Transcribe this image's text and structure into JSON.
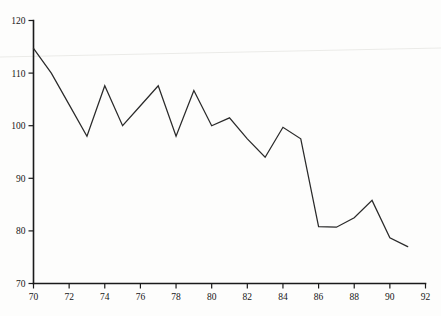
{
  "chart_data": {
    "type": "line",
    "title": "",
    "subtitle": "",
    "xlabel": "",
    "ylabel": "",
    "xlim": [
      70,
      92
    ],
    "ylim": [
      70,
      120
    ],
    "grid": false,
    "legend": null,
    "x_ticks": [
      70,
      72,
      74,
      76,
      78,
      80,
      82,
      84,
      86,
      88,
      90,
      92
    ],
    "y_ticks": [
      70,
      80,
      90,
      100,
      110,
      120
    ],
    "x_tick_labels": [
      "70",
      "72",
      "74",
      "76",
      "78",
      "80",
      "82",
      "84",
      "86",
      "88",
      "90",
      "92"
    ],
    "y_tick_labels": [
      "70",
      "80",
      "90",
      "100",
      "110",
      "120"
    ],
    "x": [
      70,
      71,
      72,
      73,
      74,
      75,
      76,
      77,
      78,
      79,
      80,
      81,
      82,
      83,
      84,
      85,
      86,
      87,
      88,
      89,
      90,
      91
    ],
    "values": [
      114.7,
      110.0,
      104.0,
      98.0,
      107.6,
      100.0,
      103.8,
      107.6,
      98.0,
      106.7,
      100.0,
      101.5,
      97.5,
      94.0,
      99.7,
      97.5,
      80.8,
      80.7,
      82.5,
      85.8,
      78.7,
      77.0
    ],
    "series": [
      {
        "name": "series-1",
        "values": [
          114.7,
          110.0,
          104.0,
          98.0,
          107.6,
          100.0,
          103.8,
          107.6,
          98.0,
          106.7,
          100.0,
          101.5,
          97.5,
          94.0,
          99.7,
          97.5,
          80.8,
          80.7,
          82.5,
          85.8,
          78.7,
          77.0
        ]
      }
    ],
    "line_color": "#2a2a2a",
    "background_color": "#fdfdfc"
  },
  "figure": {
    "width": 441,
    "height": 316,
    "axis_color": "#1a1a1a"
  }
}
